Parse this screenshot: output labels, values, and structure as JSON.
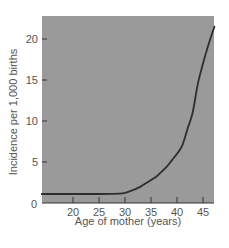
{
  "chart_data": {
    "type": "line",
    "title": "",
    "xlabel": "Age of mother (years)",
    "ylabel": "Incidence per 1,000 births",
    "xlim": [
      14,
      47.2
    ],
    "ylim": [
      0,
      22.5
    ],
    "xticks": [
      20,
      25,
      30,
      35,
      40,
      45
    ],
    "yticks": [
      0,
      5,
      10,
      15,
      20
    ],
    "grid": false,
    "legend": null,
    "series": [
      {
        "name": "Incidence",
        "x": [
          14,
          20,
          25,
          29,
          30,
          31,
          32,
          33,
          34,
          35,
          36,
          37,
          38,
          39,
          40,
          41,
          42,
          43,
          44,
          45,
          46,
          47.2
        ],
        "values": [
          1.1,
          1.1,
          1.1,
          1.15,
          1.25,
          1.45,
          1.7,
          2.0,
          2.4,
          2.8,
          3.2,
          3.8,
          4.4,
          5.2,
          6.0,
          7.0,
          9.0,
          11.0,
          14.5,
          17.0,
          19.2,
          21.5
        ]
      }
    ],
    "colors": {
      "plot_background": "#9a9a9a",
      "line": "#2e2e2e",
      "text": "#555555",
      "axis": "#333333"
    }
  }
}
